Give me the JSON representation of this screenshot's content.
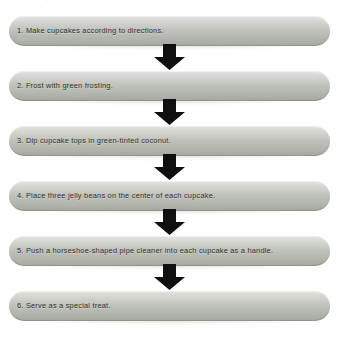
{
  "document": {
    "type": "flowchart",
    "orientation": "vertical",
    "title_remnant": "··      ·",
    "background_color": "#ffffff",
    "box_fill_top": "#d8d9d6",
    "box_fill_bottom": "#a3a79d",
    "text_color": "#2e2e2c",
    "arrow_color": "#0f0f0f"
  },
  "steps": [
    {
      "number": "1.",
      "text": "1. Make cupcakes according to directions."
    },
    {
      "number": "2.",
      "text": "2. Frost with green frosting."
    },
    {
      "number": "3.",
      "text": "3. Dip cupcake tops in green-tinted coconut."
    },
    {
      "number": "4.",
      "text": "4. Place three jelly beans on the center of each cupcake."
    },
    {
      "number": "5.",
      "text": "5. Push a horseshoe-shaped pipe cleaner into each cupcake as a handle."
    },
    {
      "number": "6.",
      "text": "6. Serve as a special treat."
    }
  ],
  "connectors": [
    {
      "label": "down-arrow-1-to-2"
    },
    {
      "label": "down-arrow-2-to-3"
    },
    {
      "label": "down-arrow-3-to-4"
    },
    {
      "label": "down-arrow-4-to-5"
    },
    {
      "label": "down-arrow-5-to-6"
    }
  ]
}
